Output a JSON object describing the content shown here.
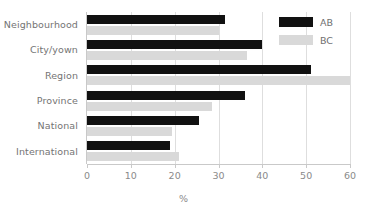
{
  "chart_data": {
    "type": "bar",
    "orientation": "horizontal",
    "title": "",
    "subtitle": "",
    "xlabel": "%",
    "ylabel": "",
    "categories": [
      "Neighbourhood",
      "City/yown",
      "Region",
      "Province",
      "National",
      "International"
    ],
    "series": [
      {
        "name": "AB",
        "color": "#111111",
        "values": [
          31.5,
          40,
          51,
          36,
          25.5,
          19
        ]
      },
      {
        "name": "BC",
        "color": "#d9d9d9",
        "values": [
          30,
          36.5,
          60,
          28.5,
          19.5,
          21
        ]
      }
    ],
    "xlim": [
      0,
      60
    ],
    "xticks": [
      0,
      10,
      20,
      30,
      40,
      50,
      60
    ],
    "xtick_labels": [
      "0",
      "10",
      "20",
      "30",
      "40",
      "50",
      "60"
    ],
    "grid": true,
    "grid_axis": "x",
    "legend_position": "top-right",
    "legend_entries": [
      "AB",
      "BC"
    ]
  },
  "axis": {
    "x_title": "%"
  },
  "legend": {
    "items": [
      {
        "label": "AB"
      },
      {
        "label": "BC"
      }
    ]
  }
}
